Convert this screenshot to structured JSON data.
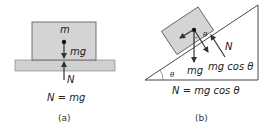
{
  "panel_a": {
    "mass_label": "m",
    "weight_label": "mg",
    "normal_label": "N",
    "equation": "N = mg",
    "caption": "(a)"
  },
  "panel_b": {
    "angle_label_block": "θ",
    "angle_label_base": "θ",
    "normal_label": "N",
    "weight_label": "mg",
    "component_label": "mg cos θ",
    "equation": "N = mg cos θ",
    "caption": "(b)"
  },
  "colors": {
    "block_fill": "#d4d4d4",
    "ground_fill": "#d0d0d0",
    "stroke": "#333333"
  }
}
